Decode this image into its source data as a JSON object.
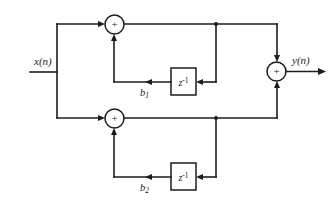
{
  "diagram": {
    "type": "signal-flow-block-diagram",
    "title": "",
    "colors": {
      "line": "#1c1c1c",
      "background": "#ffffff",
      "fill": "#ffffff"
    },
    "input": {
      "label": "x(n)",
      "name": "input-signal"
    },
    "output": {
      "label": "y(n)",
      "name": "output-signal"
    },
    "adders": [
      {
        "id": "adder-top",
        "symbol": "+",
        "cx": 114.5,
        "cy": 24.5,
        "r": 9.5
      },
      {
        "id": "adder-bottom",
        "symbol": "+",
        "cx": 114.5,
        "cy": 118.5,
        "r": 9.5
      },
      {
        "id": "adder-output",
        "symbol": "+",
        "cx": 276.5,
        "cy": 71.5,
        "r": 9.5
      }
    ],
    "delay_blocks": [
      {
        "id": "delay-top",
        "label": "z",
        "exponent": "-1",
        "x": 171,
        "y": 68,
        "w": 25,
        "h": 27
      },
      {
        "id": "delay-bottom",
        "label": "z",
        "exponent": "-1",
        "x": 171,
        "y": 163,
        "w": 25,
        "h": 27
      }
    ],
    "coefficients": [
      {
        "id": "coef-b1",
        "base": "b",
        "subscript": "1",
        "display": "b1"
      },
      {
        "id": "coef-b2",
        "base": "b",
        "subscript": "2",
        "display": "b2"
      }
    ]
  }
}
